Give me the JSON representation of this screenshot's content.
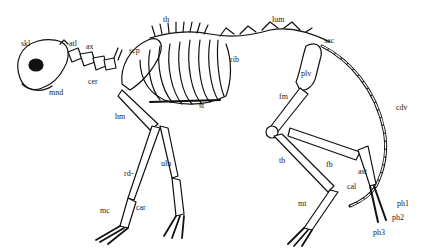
{
  "diagram": {
    "colors": {
      "ink": "#111111",
      "background": "#ffffff"
    },
    "labels": [
      {
        "id": "skl",
        "text": "skl",
        "x": 21,
        "y": 40
      },
      {
        "id": "atl",
        "text": "atl",
        "x": 69,
        "y": 40
      },
      {
        "id": "ax",
        "text": "ax",
        "x": 86,
        "y": 43
      },
      {
        "id": "cer",
        "text": "cer",
        "x": 88,
        "y": 78
      },
      {
        "id": "mnd",
        "text": "mnd",
        "x": 49,
        "y": 89
      },
      {
        "id": "th",
        "text": "th",
        "x": 163,
        "y": 16
      },
      {
        "id": "scp",
        "text": "scp",
        "x": 129,
        "y": 47
      },
      {
        "id": "st",
        "text": "st",
        "x": 199,
        "y": 102
      },
      {
        "id": "hm",
        "text": "hm",
        "x": 115,
        "y": 113
      },
      {
        "id": "lum",
        "text": "lum",
        "x": 272,
        "y": 16
      },
      {
        "id": "sac",
        "text": "sac",
        "x": 324,
        "y": 37
      },
      {
        "id": "rib",
        "text": "rib",
        "x": 230,
        "y": 56
      },
      {
        "id": "plv",
        "text": "plv",
        "x": 301,
        "y": 70
      },
      {
        "id": "fm",
        "text": "fm",
        "x": 279,
        "y": 93
      },
      {
        "id": "cdv",
        "text": "cdv",
        "x": 396,
        "y": 104
      },
      {
        "id": "uln",
        "text": "uln",
        "x": 161,
        "y": 160
      },
      {
        "id": "rd",
        "text": "rd-",
        "x": 124,
        "y": 170
      },
      {
        "id": "car",
        "text": "car",
        "x": 136,
        "y": 204
      },
      {
        "id": "mc",
        "text": "mc",
        "x": 100,
        "y": 207
      },
      {
        "id": "tb",
        "text": "tb",
        "x": 279,
        "y": 157
      },
      {
        "id": "fb",
        "text": "fb",
        "x": 326,
        "y": 161
      },
      {
        "id": "ast",
        "text": "ast",
        "x": 358,
        "y": 168
      },
      {
        "id": "cal",
        "text": "cal",
        "x": 347,
        "y": 183
      },
      {
        "id": "mt",
        "text": "mt",
        "x": 298,
        "y": 200
      },
      {
        "id": "ph1",
        "text": "ph1",
        "x": 397,
        "y": 200
      },
      {
        "id": "ph2",
        "text": "ph2",
        "x": 392,
        "y": 214
      },
      {
        "id": "ph3",
        "text": "ph3",
        "x": 373,
        "y": 229
      }
    ]
  }
}
